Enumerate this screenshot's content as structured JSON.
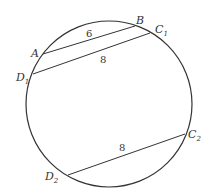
{
  "diagram": {
    "circle": {
      "cx": 109,
      "cy": 104,
      "r": 83
    },
    "points": {
      "A": {
        "label": "A",
        "sub": "",
        "x": 43,
        "y": 54
      },
      "B": {
        "label": "B",
        "sub": "",
        "x": 135,
        "y": 26
      },
      "C1": {
        "label": "C",
        "sub": "1",
        "x": 150,
        "y": 33
      },
      "D1": {
        "label": "D",
        "sub": "1",
        "x": 33,
        "y": 74
      },
      "C2": {
        "label": "C",
        "sub": "2",
        "x": 185,
        "y": 134
      },
      "D2": {
        "label": "D",
        "sub": "2",
        "x": 68,
        "y": 175
      }
    },
    "segments": [
      {
        "from": "A",
        "to": "B",
        "length_label": "6"
      },
      {
        "from": "D1",
        "to": "C1",
        "length_label": "8"
      },
      {
        "from": "D2",
        "to": "C2",
        "length_label": "8"
      }
    ],
    "stroke_color": "#333333"
  }
}
